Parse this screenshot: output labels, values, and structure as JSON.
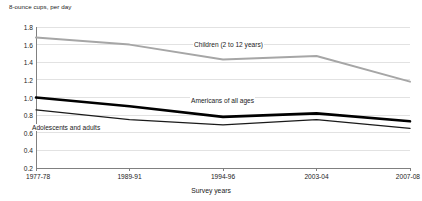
{
  "chart_data": {
    "type": "line",
    "title": "",
    "subtitle": "",
    "ylabel": "8-ounce cups, per day",
    "xlabel": "Survey years",
    "categories": [
      "1977-78",
      "1989-91",
      "1994-96",
      "2003-04",
      "2007-08"
    ],
    "ylim": [
      0.2,
      1.8
    ],
    "ytick_labels": [
      "0.2",
      "0.4",
      "0.6",
      "0.8",
      "1.0",
      "1.2",
      "1.4",
      "1.6",
      "1.8"
    ],
    "ytick_values": [
      0.2,
      0.4,
      0.6,
      0.8,
      1.0,
      1.2,
      1.4,
      1.6,
      1.8
    ],
    "grid": true,
    "legend_position": "inline-annotations",
    "series": [
      {
        "name": "Children (2 to 12 years)",
        "color": "#a6a6a6",
        "width": 2.0,
        "values": [
          1.68,
          1.6,
          1.43,
          1.47,
          1.18
        ],
        "label_text": "Children (2 to 12 years)",
        "label_x": 193,
        "label_y": 41
      },
      {
        "name": "Americans of all ages",
        "color": "#000000",
        "width": 2.6,
        "values": [
          1.0,
          0.9,
          0.78,
          0.82,
          0.73
        ],
        "label_text": "Americans of all ages",
        "label_x": 190,
        "label_y": 97
      },
      {
        "name": "Adolescents and adults",
        "color": "#1a1a1a",
        "width": 1.3,
        "values": [
          0.86,
          0.75,
          0.69,
          0.75,
          0.65
        ],
        "label_text": "Adolescents and adults",
        "label_x": 31,
        "label_y": 124
      }
    ]
  },
  "axes": {
    "y_caption": "8-ounce cups, per day",
    "x_title": "Survey years"
  },
  "colors": {
    "axis": "#808080",
    "grid": "#e2e2e2",
    "text": "#1a1a1a",
    "children_line": "#a6a6a6",
    "all_ages_line": "#000000",
    "adolescents_line": "#1a1a1a",
    "background": "#ffffff"
  }
}
